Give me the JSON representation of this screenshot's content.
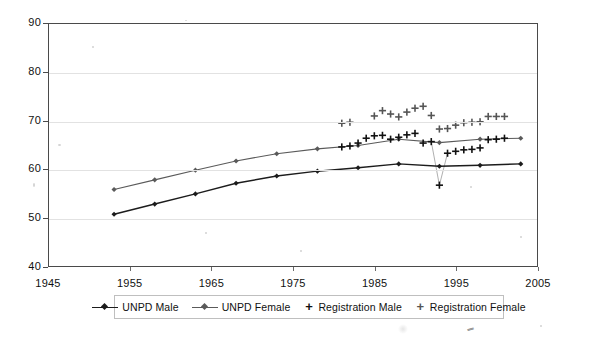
{
  "chart_data": {
    "type": "line",
    "title": "",
    "subtitle": "",
    "xlabel": "",
    "ylabel": "",
    "xlim": [
      1945,
      2005
    ],
    "ylim": [
      40,
      90
    ],
    "x_ticks": [
      1945,
      1955,
      1965,
      1975,
      1985,
      1995,
      2005
    ],
    "y_ticks": [
      40,
      50,
      60,
      70,
      80,
      90
    ],
    "grid": true,
    "legend_position": "bottom",
    "series": [
      {
        "name": "UNPD Male",
        "marker": "diamond",
        "style": "line",
        "color": "#1c1c1c",
        "x": [
          1953,
          1958,
          1963,
          1968,
          1973,
          1978,
          1983,
          1988,
          1993,
          1998,
          2003
        ],
        "values": [
          50.7,
          52.8,
          54.9,
          57.1,
          58.6,
          59.6,
          60.3,
          61.1,
          60.6,
          60.8,
          61.1
        ]
      },
      {
        "name": "UNPD Female",
        "marker": "diamond",
        "style": "line",
        "color": "#5a5a5a",
        "x": [
          1953,
          1958,
          1963,
          1968,
          1973,
          1978,
          1983,
          1988,
          1993,
          1998,
          2003
        ],
        "values": [
          55.8,
          57.8,
          59.8,
          61.7,
          63.2,
          64.2,
          64.9,
          66.2,
          65.5,
          66.2,
          66.4
        ]
      },
      {
        "name": "Registration Male",
        "marker": "plus",
        "style": "scatter",
        "color": "#111111",
        "x": [
          1981,
          1982,
          1983,
          1984,
          1985,
          1986,
          1987,
          1988,
          1989,
          1990,
          1991,
          1992,
          1993,
          1994,
          1995,
          1996,
          1997,
          1998,
          1999,
          2000,
          2001
        ],
        "values": [
          64.6,
          64.8,
          65.4,
          66.4,
          66.9,
          67.0,
          66.2,
          66.6,
          67.1,
          67.4,
          65.4,
          65.7,
          56.7,
          63.3,
          63.7,
          64.0,
          64.1,
          64.4,
          66.1,
          66.2,
          66.4
        ]
      },
      {
        "name": "Registration Female",
        "marker": "plus",
        "style": "scatter",
        "color": "#555555",
        "x": [
          1981,
          1982,
          1985,
          1986,
          1987,
          1988,
          1989,
          1990,
          1991,
          1992,
          1993,
          1994,
          1995,
          1996,
          1997,
          1998,
          1999,
          2000,
          2001
        ],
        "values": [
          69.5,
          69.7,
          71.0,
          72.1,
          71.4,
          70.8,
          71.8,
          72.6,
          73.0,
          71.1,
          68.3,
          68.4,
          69.1,
          69.6,
          69.7,
          69.8,
          70.9,
          70.9,
          70.9
        ]
      }
    ]
  },
  "axes": {
    "y_labels": [
      "90",
      "80",
      "70",
      "60",
      "50",
      "40"
    ],
    "x_labels": [
      "1945",
      "1955",
      "1965",
      "1975",
      "1985",
      "1995",
      "2005"
    ]
  },
  "legend": {
    "items": [
      {
        "label": "UNPD Male",
        "marker": "line-diamond",
        "color": "#1c1c1c"
      },
      {
        "label": "UNPD Female",
        "marker": "line-diamond",
        "color": "#5a5a5a"
      },
      {
        "label": "Registration Male",
        "marker": "plus",
        "color": "#111111"
      },
      {
        "label": "Registration Female",
        "marker": "plus",
        "color": "#555555"
      }
    ]
  }
}
